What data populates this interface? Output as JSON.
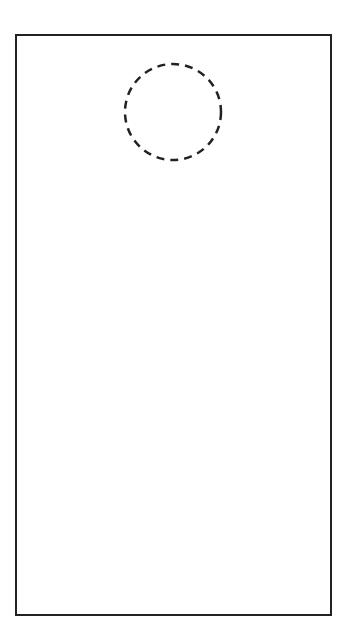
{
  "diagram": {
    "type": "door-hanger-template",
    "outline": {
      "shape": "rectangle",
      "stroke": "#222222"
    },
    "hole": {
      "shape": "circle",
      "style": "dashed",
      "stroke": "#222222",
      "cx": 173,
      "cy": 112,
      "r": 48
    }
  }
}
